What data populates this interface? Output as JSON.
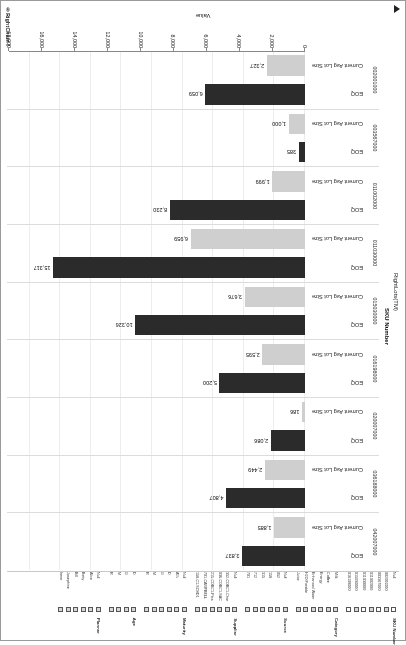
{
  "brand": {
    "logo_text": "®RightChain™"
  },
  "filters": [
    {
      "title": "SKU Number",
      "items": [
        {
          "label": "Null",
          "checked": false
        },
        {
          "label": "002001000",
          "checked": true
        },
        {
          "label": "003567000",
          "checked": false
        },
        {
          "label": "011002000",
          "checked": true
        },
        {
          "label": "011030000",
          "checked": false
        },
        {
          "label": "015030000",
          "checked": true
        },
        {
          "label": "016198000",
          "checked": false
        }
      ]
    },
    {
      "title": "Category",
      "items": [
        {
          "label": "Milk",
          "checked": true
        },
        {
          "label": "Coffee",
          "checked": true
        },
        {
          "label": "Energy",
          "checked": true
        },
        {
          "label": "Enhanced Water",
          "checked": true
        },
        {
          "label": "H2O Potable",
          "checked": true
        },
        {
          "label": "Juice",
          "checked": true
        }
      ]
    },
    {
      "title": "Source",
      "items": [
        {
          "label": "Null",
          "checked": true
        },
        {
          "label": "052",
          "checked": true
        },
        {
          "label": "158",
          "checked": true
        },
        {
          "label": "315",
          "checked": true
        },
        {
          "label": "712",
          "checked": true
        },
        {
          "label": "701",
          "checked": true
        }
      ]
    },
    {
      "title": "Supplier",
      "items": [
        {
          "label": "Null",
          "checked": true
        },
        {
          "label": "352-COBC1-Char",
          "checked": true
        },
        {
          "label": "036-COBC1-SAC",
          "checked": true
        },
        {
          "label": "215-COBC1-Pitts",
          "checked": true
        },
        {
          "label": "701-CAMPBELL",
          "checked": true
        },
        {
          "label": "158-C1-SCHD1",
          "checked": true
        }
      ]
    },
    {
      "title": "Maturity",
      "items": [
        {
          "label": "Null",
          "checked": true
        },
        {
          "label": "A%",
          "checked": true
        },
        {
          "label": "D",
          "checked": true
        },
        {
          "label": "G",
          "checked": true
        },
        {
          "label": "M",
          "checked": true
        },
        {
          "label": "R",
          "checked": true
        }
      ]
    },
    {
      "title": "Age",
      "items": [
        {
          "label": "D",
          "checked": true
        },
        {
          "label": "G",
          "checked": true
        },
        {
          "label": "M",
          "checked": true
        },
        {
          "label": "R",
          "checked": true
        }
      ]
    },
    {
      "title": "Planner",
      "items": [
        {
          "label": "Null",
          "checked": true
        },
        {
          "label": "Alice",
          "checked": true
        },
        {
          "label": "Betty",
          "checked": true
        },
        {
          "label": "Bill",
          "checked": true
        },
        {
          "label": "Josephine",
          "checked": true
        },
        {
          "label": "Irene",
          "checked": true
        }
      ]
    }
  ],
  "chart_data": {
    "type": "bar",
    "orientation": "horizontal",
    "title": "",
    "xlabel": "Value",
    "ylabel": "RightLots(TM)",
    "y_group_label": "SKU Number",
    "xlim": [
      0,
      18000
    ],
    "xticks": [
      "0",
      "2,000",
      "4,000",
      "6,000",
      "8,000",
      "10,000",
      "12,000",
      "14,000",
      "16,000",
      "18,000"
    ],
    "grid": true,
    "legend": "none",
    "measures": [
      "EOQ",
      "Current Avg Lot Size"
    ],
    "colors": {
      "eoq": "#2b2b2b",
      "lot": "#cfcfcf"
    },
    "categories": [
      "042007000",
      "036188000",
      "020007000",
      "016198000",
      "015030000",
      "011030000",
      "011002000",
      "003567000",
      "002001000"
    ],
    "series": [
      {
        "name": "EOQ",
        "values": [
          3837,
          4807,
          2086,
          5200,
          10326,
          15317,
          8230,
          385,
          6059
        ],
        "labels": [
          "3,837",
          "4,807",
          "2,086",
          "5,200",
          "10,326",
          "15,317",
          "8,230",
          "385",
          "6,059"
        ]
      },
      {
        "name": "Current Avg Lot Size",
        "values": [
          1885,
          2449,
          186,
          2595,
          3676,
          6959,
          1999,
          1000,
          2327
        ],
        "labels": [
          "1,885",
          "2,449",
          "186",
          "2,595",
          "3,676",
          "6,959",
          "1,999",
          "1,000",
          "2,327"
        ]
      }
    ]
  }
}
